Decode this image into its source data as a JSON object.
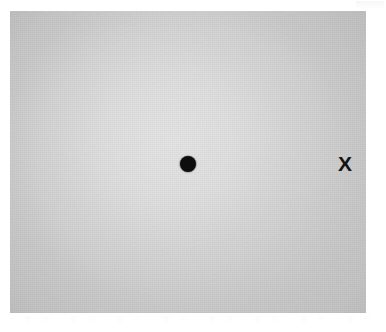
{
  "figure": {
    "background_color": "#ffffff",
    "width": 386,
    "height": 332
  },
  "stimulus_field": {
    "name": "gray-stimulus-field",
    "fill_color": "#c9c9c9",
    "center_highlight_color": "#d3d3d3",
    "edge_shade_color": "#bdbdbd",
    "left": 10,
    "top": 11,
    "width": 356,
    "height": 302
  },
  "markers": {
    "fixation_dot": {
      "label": "",
      "shape": "filled-circle",
      "color": "#0d0d0d",
      "diameter": 16,
      "center_x": 188,
      "center_y": 164
    },
    "target": {
      "label": "X",
      "shape": "letter",
      "color": "#141414",
      "font_size": 21,
      "center_x": 345,
      "center_y": 163
    }
  },
  "artifacts": {
    "top_right_smudge": "scan-artifact",
    "bottom_band_smudge": "scan-artifact"
  }
}
